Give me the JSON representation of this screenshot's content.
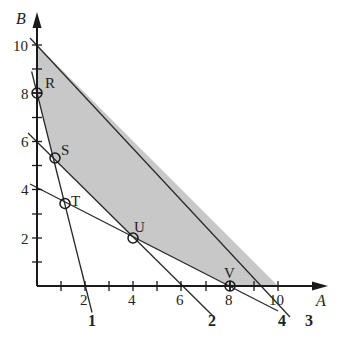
{
  "diagram": {
    "type": "linear-programming-feasible-region",
    "axes": {
      "x_label": "A",
      "y_label": "B",
      "x_ticks": [
        {
          "value": 2,
          "label": "2"
        },
        {
          "value": 4,
          "label": "4"
        },
        {
          "value": 6,
          "label": "6"
        },
        {
          "value": 8,
          "label": "8"
        },
        {
          "value": 10,
          "label": "10"
        }
      ],
      "y_ticks": [
        {
          "value": 2,
          "label": "2"
        },
        {
          "value": 4,
          "label": "4"
        },
        {
          "value": 6,
          "label": "6"
        },
        {
          "value": 8,
          "label": "8"
        },
        {
          "value": 10,
          "label": "10"
        }
      ],
      "minor_ticks": [
        1,
        3,
        5,
        7,
        9
      ]
    },
    "constraint_lines": [
      {
        "id": "1",
        "label": "1",
        "equation": "4A + B = 8"
      },
      {
        "id": "2",
        "label": "2",
        "equation": "A + B = 6"
      },
      {
        "id": "3",
        "label": "3",
        "equation": "A + B = 10"
      },
      {
        "id": "4",
        "label": "4",
        "equation": "A + 2B = 8"
      }
    ],
    "points": [
      {
        "label": "R",
        "A": 0,
        "B": 8
      },
      {
        "label": "S",
        "A": 0.67,
        "B": 5.33
      },
      {
        "label": "T",
        "A": 1.14,
        "B": 3.43
      },
      {
        "label": "U",
        "A": 4,
        "B": 2
      },
      {
        "label": "V",
        "A": 8,
        "B": 0
      }
    ],
    "feasible_region": {
      "fill": "#c8c8c8",
      "vertices": [
        [
          0,
          10
        ],
        [
          10,
          0
        ],
        [
          8,
          0
        ],
        [
          4,
          2
        ],
        [
          0.67,
          5.33
        ],
        [
          0,
          8
        ]
      ]
    },
    "colors": {
      "line": "#2a2a2a",
      "shade": "#c8c8c8",
      "background": "#ffffff"
    }
  }
}
